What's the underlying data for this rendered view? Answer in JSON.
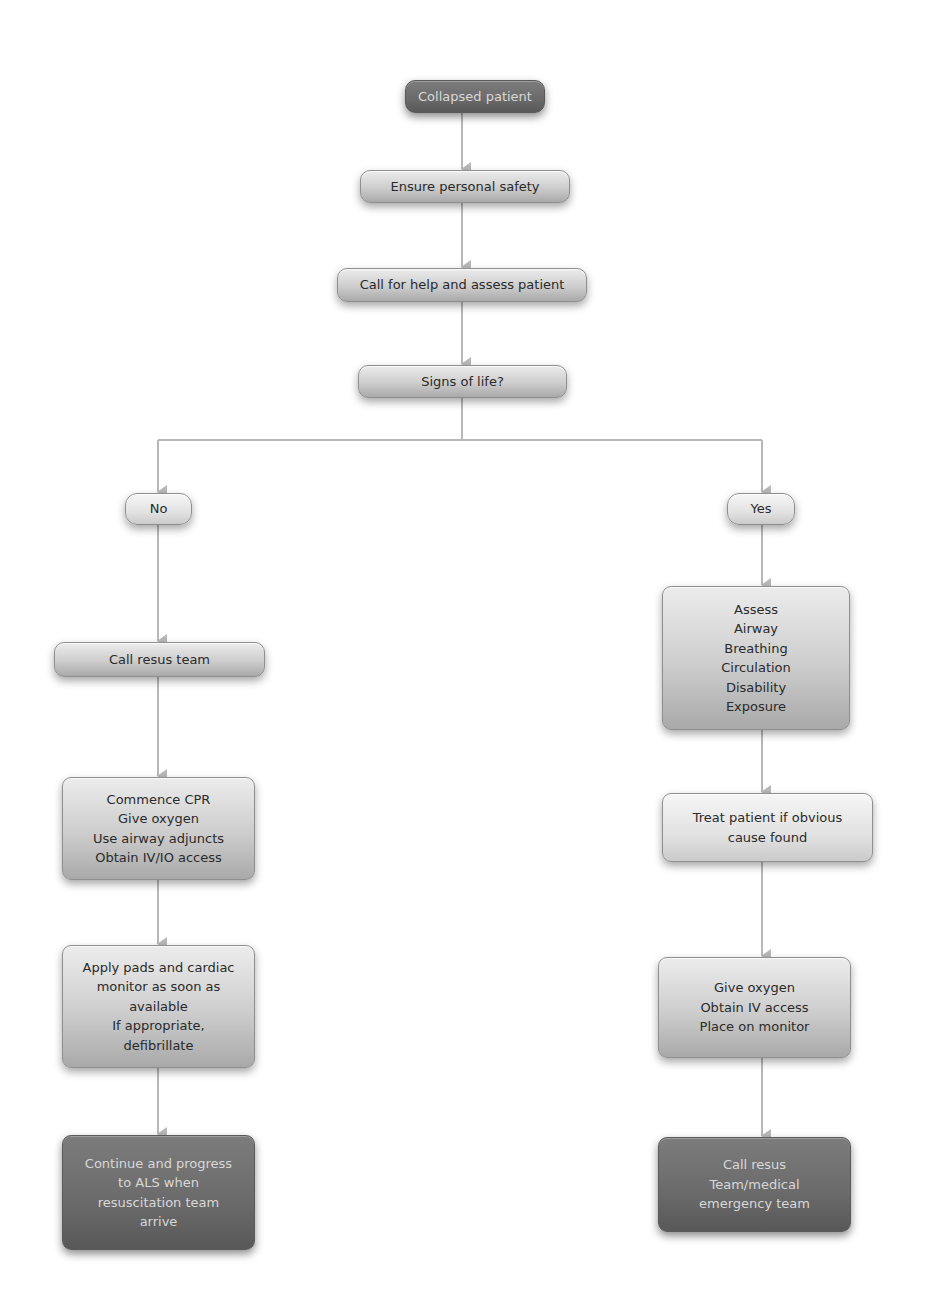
{
  "diagram": {
    "title": "Collapsed patient",
    "colors": {
      "connector": "#b5b5b5",
      "dark_node": "#6a6a6a",
      "mid_node": "#c4c4c4",
      "light_node": "#e2e2e2"
    },
    "top": {
      "collapsed": "Collapsed patient",
      "safety": "Ensure personal safety",
      "assess": "Call for help and assess patient",
      "decision": "Signs of life?"
    },
    "branches": {
      "no": {
        "label": "No",
        "steps": [
          {
            "lines": [
              "Call resus team"
            ]
          },
          {
            "lines": [
              "Commence CPR",
              "Give oxygen",
              "Use airway adjuncts",
              "Obtain IV/IO access"
            ]
          },
          {
            "lines": [
              "Apply pads and cardiac",
              "monitor as soon as",
              "available",
              "If appropriate,",
              "defibrillate"
            ]
          },
          {
            "lines": [
              "Continue and progress",
              "to ALS when",
              "resuscitation team",
              "arrive"
            ]
          }
        ]
      },
      "yes": {
        "label": "Yes",
        "steps": [
          {
            "lines": [
              "Assess",
              "Airway",
              "Breathing",
              "Circulation",
              "Disability",
              "Exposure"
            ]
          },
          {
            "lines": [
              "Treat patient if obvious",
              "cause found"
            ]
          },
          {
            "lines": [
              "Give oxygen",
              "Obtain IV access",
              "Place on monitor"
            ]
          },
          {
            "lines": [
              "Call resus",
              "Team/medical",
              "emergency team"
            ]
          }
        ]
      }
    }
  }
}
